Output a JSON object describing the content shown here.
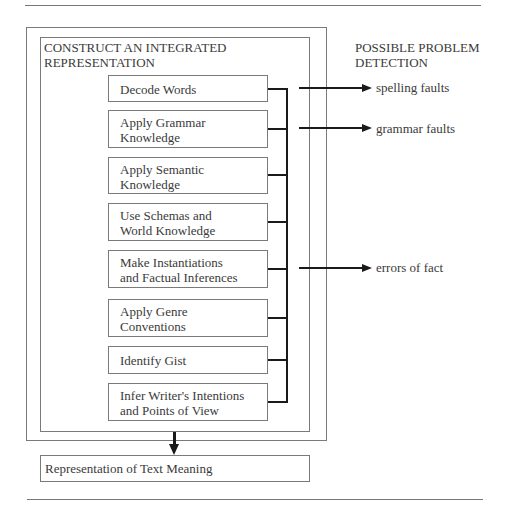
{
  "diagram": {
    "outer_heading": [
      "CONSTRUCT AN INTEGRATED",
      "REPRESENTATION"
    ],
    "side_heading": [
      "POSSIBLE PROBLEM",
      "DETECTION"
    ],
    "steps": [
      {
        "line1": "Decode Words",
        "line2": ""
      },
      {
        "line1": "Apply Grammar",
        "line2": "Knowledge"
      },
      {
        "line1": "Apply Semantic",
        "line2": "Knowledge"
      },
      {
        "line1": "Use Schemas and",
        "line2": "World Knowledge"
      },
      {
        "line1": "Make Instantiations",
        "line2": "and Factual Inferences"
      },
      {
        "line1": "Apply Genre",
        "line2": "Conventions"
      },
      {
        "line1": "Identify Gist",
        "line2": ""
      },
      {
        "line1": "Infer Writer's Intentions",
        "line2": "and Points of View"
      }
    ],
    "detections": [
      {
        "label": "spelling faults"
      },
      {
        "label": "grammar faults"
      },
      {
        "label": "errors of fact"
      }
    ],
    "output_box": "Representation of Text Meaning",
    "colors": {
      "line": "#1a1a1a",
      "frame": "#7a7a7a",
      "text": "#3a3a3a"
    }
  }
}
